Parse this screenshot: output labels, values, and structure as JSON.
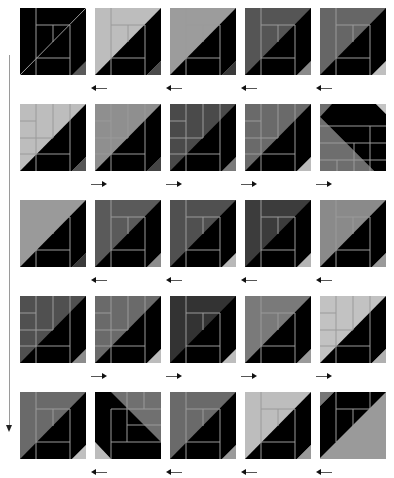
{
  "diagram": {
    "colors": {
      "black": "#000000",
      "line": "#9a9a9a",
      "background": "#ffffff"
    },
    "rows": [
      {
        "arrow_direction": "left",
        "tiles": [
          {
            "bg": "#000000",
            "corner": "#5a5a5a",
            "variant": "a"
          },
          {
            "bg": "#bdbdbd",
            "corner": "#4a4a4a",
            "variant": "a"
          },
          {
            "bg": "#9c9c9c",
            "corner": "#3a3a3a",
            "variant": "a"
          },
          {
            "bg": "#555555",
            "corner": "#8a8a8a",
            "variant": "a"
          },
          {
            "bg": "#666666",
            "corner": "#bfbfbf",
            "variant": "a"
          }
        ]
      },
      {
        "arrow_direction": "right",
        "tiles": [
          {
            "bg": "#bdbdbd",
            "corner": "#555555",
            "variant": "b"
          },
          {
            "bg": "#8f8f8f",
            "corner": "#444444",
            "variant": "b"
          },
          {
            "bg": "#4a4a4a",
            "corner": "#7a7a7a",
            "variant": "b"
          },
          {
            "bg": "#6a6a6a",
            "corner": "#bbbbbb",
            "variant": "b"
          },
          {
            "bg": "#6e6e6e",
            "corner": "#c4c4c4",
            "variant": "c"
          }
        ]
      },
      {
        "arrow_direction": "left",
        "tiles": [
          {
            "bg": "#9a9a9a",
            "corner": "#3a3a3a",
            "variant": "a"
          },
          {
            "bg": "#5a5a5a",
            "corner": "#8c8c8c",
            "variant": "a"
          },
          {
            "bg": "#505050",
            "corner": "#b8b8b8",
            "variant": "a"
          },
          {
            "bg": "#3c3c3c",
            "corner": "#b4b4b4",
            "variant": "a"
          },
          {
            "bg": "#8a8a8a",
            "corner": "#9a9a9a",
            "variant": "a"
          }
        ]
      },
      {
        "arrow_direction": "right",
        "tiles": [
          {
            "bg": "#505050",
            "corner": "#8c8c8c",
            "variant": "b"
          },
          {
            "bg": "#6a6a6a",
            "corner": "#bcbcbc",
            "variant": "b"
          },
          {
            "bg": "#333333",
            "corner": "#bdbdbd",
            "variant": "a"
          },
          {
            "bg": "#7a7a7a",
            "corner": "#9a9a9a",
            "variant": "a"
          },
          {
            "bg": "#c2c2c2",
            "corner": "#b0b0b0",
            "variant": "b"
          }
        ]
      },
      {
        "arrow_direction": "left",
        "tiles": [
          {
            "bg": "#6a6a6a",
            "corner": "#c0c0c0",
            "variant": "a"
          },
          {
            "bg": "#707070",
            "corner": "#bcbcbc",
            "variant": "d"
          },
          {
            "bg": "#6a6a6a",
            "corner": "#9a9a9a",
            "variant": "a"
          },
          {
            "bg": "#bdbdbd",
            "corner": "#9a9a9a",
            "variant": "a"
          },
          {
            "bg": "#9a9a9a",
            "corner": "#9a9a9a",
            "variant": "e"
          }
        ]
      }
    ],
    "layout": {
      "tile_x": [
        20,
        95,
        170,
        245,
        320
      ],
      "row_y": [
        8,
        104,
        200,
        296,
        392
      ],
      "arrow_x": [
        86,
        161,
        236,
        311
      ],
      "arrow_y_offset": 77
    }
  }
}
